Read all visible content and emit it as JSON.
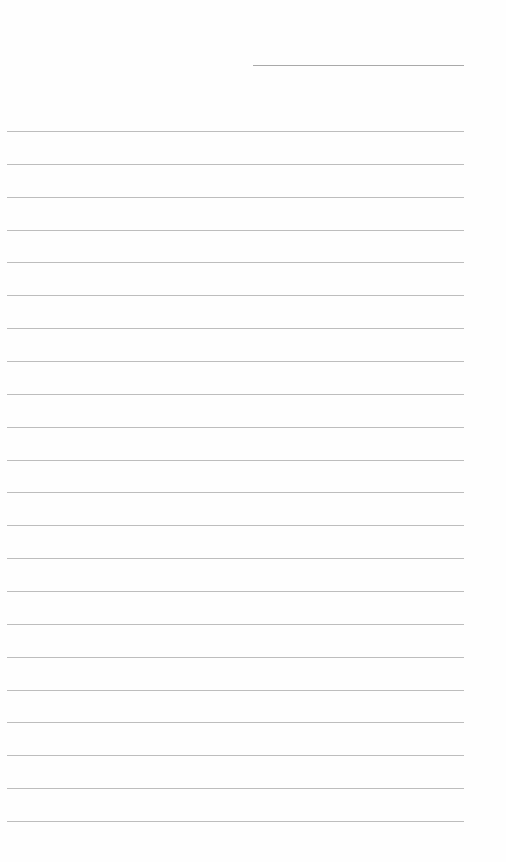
{
  "page": {
    "type": "lined-writing-paper",
    "background_color": "#fefefe",
    "line_color": "#bdbdbd",
    "header_line": {
      "label": "",
      "x": 253,
      "y": 65,
      "width": 211
    },
    "ruled_lines": {
      "count": 22,
      "first_y": 131,
      "spacing": 32.86,
      "x": 7,
      "width": 457
    }
  }
}
